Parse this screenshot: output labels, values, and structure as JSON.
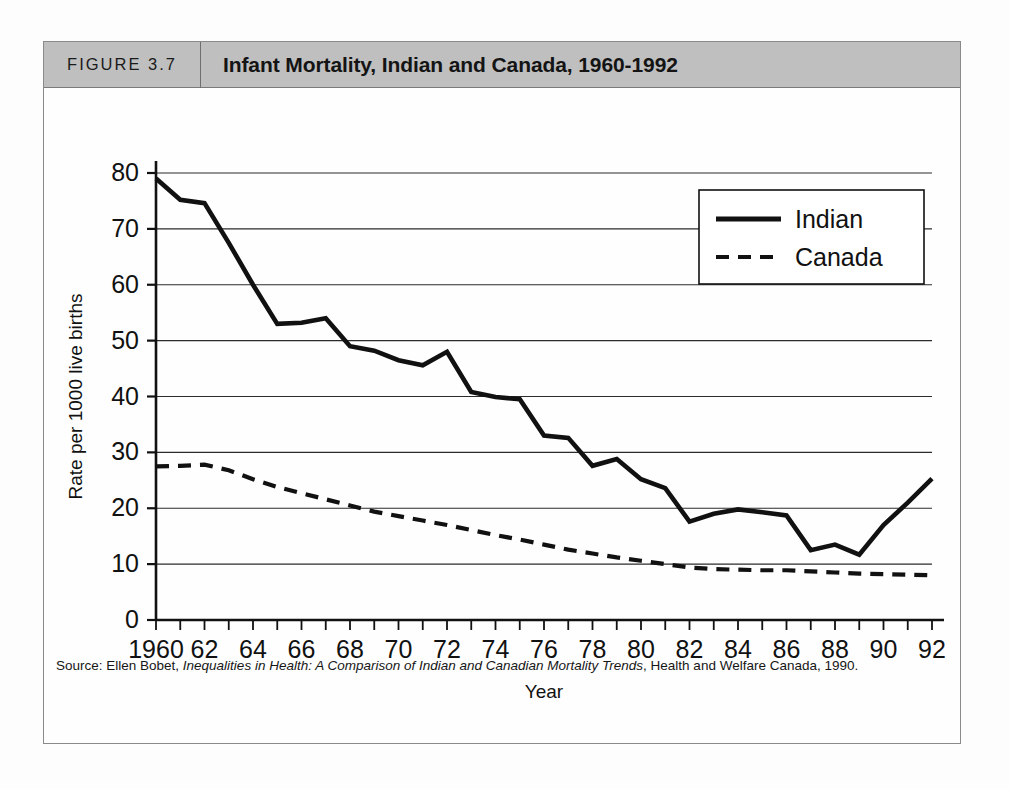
{
  "figure": {
    "number_label": "FIGURE 3.7",
    "title": "Infant Mortality, Indian and Canada, 1960-1992",
    "header_bg": "#bfbfbf",
    "frame_color": "#8a8a8a"
  },
  "source": {
    "prefix": "Source: Ellen Bobet, ",
    "italic_title": "Inequalities in Health: A Comparison of Indian and Canadian Mortality Trends",
    "suffix": ", Health and Welfare Canada, 1990."
  },
  "chart_data": {
    "type": "line",
    "title": "Infant Mortality, Indian and Canada, 1960-1992",
    "xlabel": "Year",
    "ylabel": "Rate per 1000 live births",
    "xlim": [
      1960,
      1992
    ],
    "ylim": [
      0,
      80
    ],
    "yticks": [
      0,
      10,
      20,
      30,
      40,
      50,
      60,
      70,
      80
    ],
    "ytick_labels": [
      "0",
      "10",
      "20",
      "30",
      "40",
      "50",
      "60",
      "70",
      "80"
    ],
    "grid": "horizontal",
    "legend_position": "top-right",
    "x": [
      1960,
      1961,
      1962,
      1963,
      1964,
      1965,
      1966,
      1967,
      1968,
      1969,
      1970,
      1971,
      1972,
      1973,
      1974,
      1975,
      1976,
      1977,
      1978,
      1979,
      1980,
      1981,
      1982,
      1983,
      1984,
      1985,
      1986,
      1987,
      1988,
      1989,
      1990,
      1991,
      1992
    ],
    "xtick_labels": [
      "1960",
      "",
      "62",
      "",
      "64",
      "",
      "66",
      "",
      "68",
      "",
      "70",
      "",
      "72",
      "",
      "74",
      "",
      "76",
      "",
      "78",
      "",
      "80",
      "",
      "82",
      "",
      "84",
      "",
      "86",
      "",
      "88",
      "",
      "90",
      "",
      "92"
    ],
    "series": [
      {
        "name": "Indian",
        "style": "solid",
        "color": "#111111",
        "values": [
          79.0,
          75.2,
          74.6,
          67.5,
          60.0,
          53.0,
          53.2,
          54.0,
          49.0,
          48.2,
          46.5,
          45.6,
          48.0,
          40.8,
          39.9,
          39.5,
          33.0,
          32.6,
          27.6,
          28.8,
          25.2,
          23.6,
          17.6,
          19.0,
          19.8,
          19.3,
          18.7,
          12.5,
          13.5,
          11.7,
          17.0,
          21.0,
          25.3
        ]
      },
      {
        "name": "Canada",
        "style": "dashed",
        "color": "#111111",
        "values": [
          27.5,
          27.6,
          27.8,
          26.8,
          25.2,
          23.8,
          22.7,
          21.6,
          20.5,
          19.4,
          18.6,
          17.8,
          17.0,
          16.1,
          15.2,
          14.4,
          13.5,
          12.6,
          11.9,
          11.2,
          10.6,
          10.0,
          9.4,
          9.1,
          9.0,
          8.9,
          8.9,
          8.7,
          8.5,
          8.3,
          8.2,
          8.1,
          8.0
        ]
      }
    ],
    "legend": [
      {
        "label": "Indian",
        "style": "solid"
      },
      {
        "label": "Canada",
        "style": "dashed"
      }
    ]
  }
}
